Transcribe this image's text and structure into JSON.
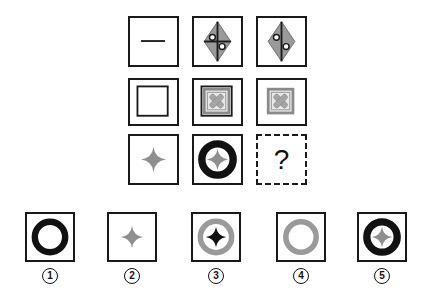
{
  "puzzle": {
    "grid": [
      [
        {
          "id": "r1c1",
          "figure": "horizontal-line"
        },
        {
          "id": "r1c2",
          "figure": "gray-diamond-with-cross-and-two-circles"
        },
        {
          "id": "r1c3",
          "figure": "gray-diamond-with-vertical-line-and-two-circles"
        }
      ],
      [
        {
          "id": "r2c1",
          "figure": "nested-black-square"
        },
        {
          "id": "r2c2",
          "figure": "nested-black-square-with-gray-square-and-gray-x"
        },
        {
          "id": "r2c3",
          "figure": "gray-square-with-gray-x"
        }
      ],
      [
        {
          "id": "r3c1",
          "figure": "gray-four-point-star"
        },
        {
          "id": "r3c2",
          "figure": "black-ring-with-gray-four-point-star"
        },
        {
          "id": "r3c3",
          "figure": "unknown",
          "label": "?"
        }
      ]
    ],
    "options": [
      {
        "number": "1",
        "figure": "black-ring"
      },
      {
        "number": "2",
        "figure": "gray-four-point-star"
      },
      {
        "number": "3",
        "figure": "gray-ring-with-black-four-point-star"
      },
      {
        "number": "4",
        "figure": "gray-ring"
      },
      {
        "number": "5",
        "figure": "black-ring-with-gray-four-point-star"
      }
    ],
    "colors": {
      "stroke": "#1a1a1a",
      "gray_fill": "#9a9a9a",
      "light_gray": "#b5b5b5",
      "background": "#ffffff"
    }
  }
}
